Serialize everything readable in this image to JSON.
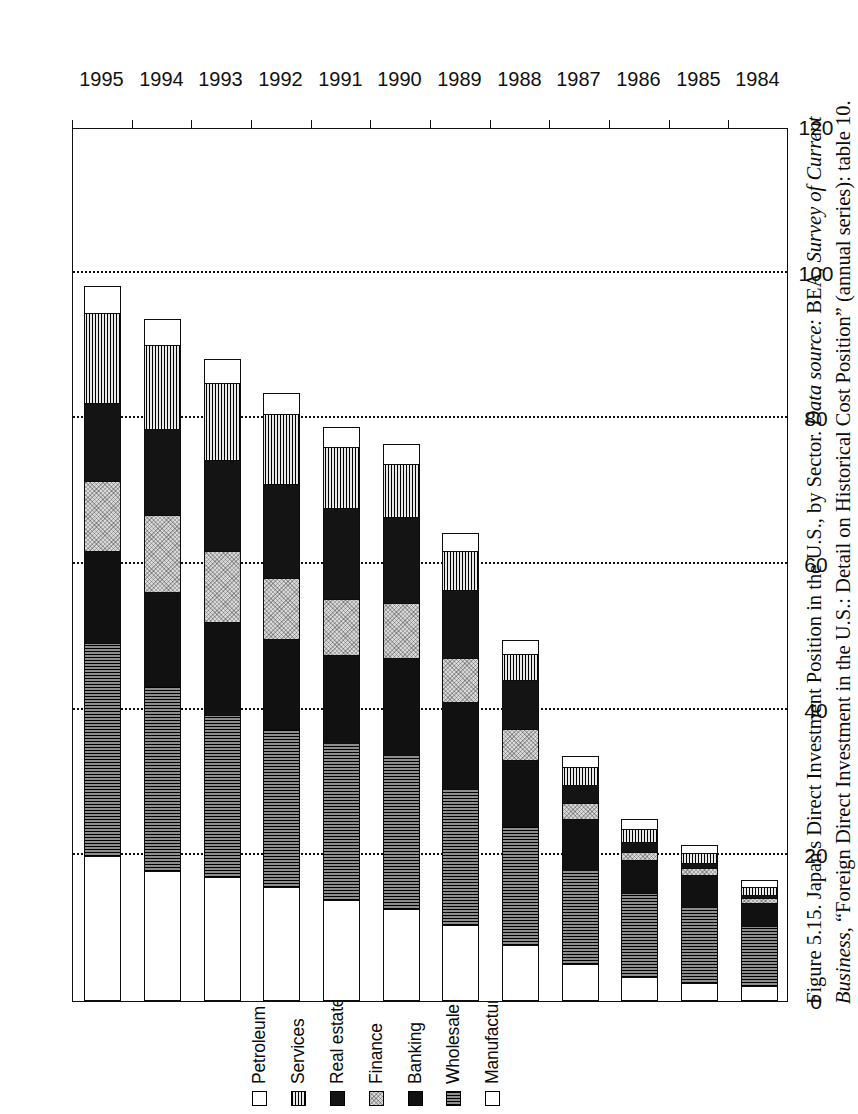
{
  "figure": {
    "caption_number": "Figure 5.15.",
    "caption_title": "Japan's Direct Investment Position in the U.S., by Sector.",
    "source_label": "Data source:",
    "source_text_a": "BEA,",
    "source_italic": "Survey of Current Business",
    "source_text_b": ", “Foreign Direct Investment in the U.S.: Detail on Historical Cost Position” (annual series): table 10."
  },
  "legend": {
    "items": [
      {
        "label": "Petroleum and other industries",
        "key": "petroleum",
        "swatch": "white-open-square"
      },
      {
        "label": "Services",
        "key": "services",
        "swatch": "horizontal-hatch-square"
      },
      {
        "label": "Real estate",
        "key": "realestate",
        "swatch": "solid-black-square"
      },
      {
        "label": "Finance",
        "key": "finance",
        "swatch": "light-speckle-square"
      },
      {
        "label": "Banking",
        "key": "banking",
        "swatch": "solid-black-square"
      },
      {
        "label": "Wholesale trade",
        "key": "wholesale",
        "swatch": "vertical-hatch-square"
      },
      {
        "label": "Manufacturing",
        "key": "manufacturing",
        "swatch": "white-open-square"
      }
    ]
  },
  "axes": {
    "value_axis_ticks": [
      "0",
      "20",
      "40",
      "60",
      "80",
      "100",
      "120"
    ],
    "value_axis_min": 0,
    "value_axis_max": 120,
    "category_axis_labels": [
      "1984",
      "1985",
      "1986",
      "1987",
      "1988",
      "1989",
      "1990",
      "1991",
      "1992",
      "1993",
      "1994",
      "1995"
    ]
  },
  "chart_data": {
    "type": "bar",
    "orientation": "horizontal-stacked",
    "title": "Japan's Direct Investment Position in the U.S., by Sector",
    "xlabel": "",
    "ylabel": "",
    "xlim": [
      0,
      120
    ],
    "grid": true,
    "legend_position": "top-left",
    "categories": [
      "1984",
      "1985",
      "1986",
      "1987",
      "1988",
      "1989",
      "1990",
      "1991",
      "1992",
      "1993",
      "1994",
      "1995"
    ],
    "stack_order_from_zero": [
      "Manufacturing",
      "Wholesale trade",
      "Banking",
      "Finance",
      "Real estate",
      "Services",
      "Petroleum and other industries"
    ],
    "series": [
      {
        "name": "Manufacturing",
        "values": [
          2.0,
          2.4,
          3.2,
          5.0,
          7.6,
          10.3,
          12.5,
          13.8,
          15.5,
          17.0,
          17.8,
          19.8
        ]
      },
      {
        "name": "Wholesale trade",
        "values": [
          8.4,
          10.6,
          11.6,
          13.0,
          16.4,
          18.8,
          21.2,
          21.6,
          21.8,
          22.2,
          25.4,
          29.4
        ]
      },
      {
        "name": "Banking",
        "values": [
          3.2,
          4.4,
          4.6,
          7.0,
          9.2,
          12.0,
          13.4,
          12.2,
          12.4,
          12.8,
          13.0,
          12.6
        ]
      },
      {
        "name": "Finance",
        "values": [
          0.6,
          1.0,
          1.2,
          2.2,
          4.2,
          6.0,
          7.6,
          7.6,
          8.4,
          9.8,
          10.6,
          9.6
        ]
      },
      {
        "name": "Real estate",
        "values": [
          0.4,
          0.6,
          1.4,
          2.6,
          6.8,
          9.4,
          11.8,
          12.6,
          13.0,
          12.6,
          11.8,
          10.8
        ]
      },
      {
        "name": "Services",
        "values": [
          1.2,
          1.4,
          1.8,
          2.4,
          3.6,
          5.4,
          7.4,
          8.4,
          9.6,
          10.6,
          11.6,
          12.4
        ]
      },
      {
        "name": "Petroleum and other industries",
        "values": [
          0.8,
          1.0,
          1.2,
          1.4,
          1.8,
          2.4,
          2.6,
          2.6,
          2.8,
          3.2,
          3.4,
          3.6
        ]
      }
    ],
    "totals": [
      16.6,
      21.4,
      25.0,
      33.6,
      49.6,
      64.3,
      76.5,
      78.8,
      83.5,
      88.2,
      93.6,
      98.2
    ]
  }
}
